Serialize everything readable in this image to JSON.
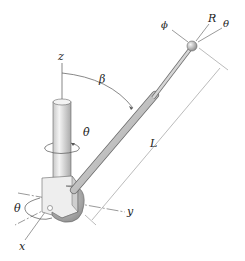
{
  "diagram": {
    "type": "mechanics-figure",
    "labels": {
      "z_axis": "z",
      "x_axis": "x",
      "y_axis": "y",
      "beta": "β",
      "theta_dot": "θ̇",
      "theta_base": "θ",
      "length": "L",
      "phi": "ϕ",
      "R": "R",
      "theta_tip": "θ"
    },
    "colors": {
      "line": "#555555",
      "metal_light": "#e8e8e8",
      "metal_mid": "#bdbdbd",
      "metal_dark": "#8a8a8a",
      "text": "#222222"
    }
  }
}
